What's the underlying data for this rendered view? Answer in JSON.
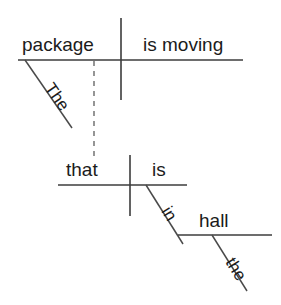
{
  "diagram": {
    "sentence": "The package is moving that is in the hall",
    "ink_color": "#3c3c3c",
    "text_color": "#1b1b1b",
    "background_color": "#ffffff",
    "clauses": [
      {
        "id": "main-clause",
        "subject": "package",
        "predicate": "is moving",
        "baseline": {
          "x1": 18,
          "y": 60,
          "x2": 243
        },
        "divider": {
          "x": 121,
          "y1": 18,
          "y2": 100
        },
        "subject_text": {
          "x": 22,
          "y": 51
        },
        "predicate_text": {
          "x": 143,
          "y": 51
        },
        "modifiers": [
          {
            "word": "The",
            "attaches_to": "package",
            "line": {
              "x1": 25,
              "y1": 60,
              "x2": 72,
              "y2": 128
            },
            "text": {
              "x": 44,
              "y": 88,
              "rotate": 55
            }
          }
        ]
      },
      {
        "id": "relative-clause",
        "subject": "that",
        "predicate": "is",
        "baseline": {
          "x1": 58,
          "y": 185,
          "x2": 187
        },
        "divider": {
          "x": 130,
          "y1": 155,
          "y2": 216
        },
        "subject_text": {
          "x": 66,
          "y": 176
        },
        "predicate_text": {
          "x": 152,
          "y": 176
        },
        "modifiers": [
          {
            "word": "in",
            "attaches_to": "is",
            "line": {
              "x1": 146,
              "y1": 185,
              "x2": 183,
              "y2": 244
            },
            "text": {
              "x": 161,
              "y": 211,
              "rotate": 58
            }
          }
        ]
      }
    ],
    "prepositional_object": {
      "word": "hall",
      "baseline": {
        "x1": 178,
        "y": 235,
        "x2": 272
      },
      "text": {
        "x": 199,
        "y": 227
      },
      "modifiers": [
        {
          "word": "the",
          "attaches_to": "hall",
          "line": {
            "x1": 212,
            "y1": 235,
            "x2": 247,
            "y2": 291
          },
          "text": {
            "x": 225,
            "y": 262,
            "rotate": 58
          }
        }
      ]
    },
    "connector": {
      "type": "dashed-vertical",
      "label": "relative-pronoun-link",
      "line": {
        "x": 94,
        "y1": 61,
        "y2": 156
      }
    }
  }
}
